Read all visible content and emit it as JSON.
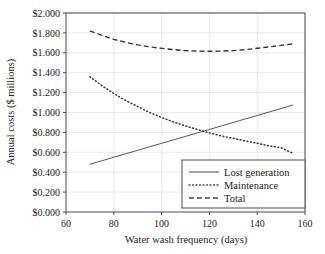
{
  "chart_data": {
    "type": "line",
    "title": "",
    "xlabel": "Water wash frequency (days)",
    "ylabel": "Annual costs ($ millions)",
    "xlim": [
      60,
      160
    ],
    "ylim": [
      0.0,
      2.0
    ],
    "xticks": [
      "60",
      "80",
      "100",
      "120",
      "140",
      "160"
    ],
    "xtick_values": [
      60,
      80,
      100,
      120,
      140,
      160
    ],
    "yticks": [
      "$0.000",
      "$0.200",
      "$0.400",
      "$0.600",
      "$0.800",
      "$1.000",
      "$1.200",
      "$1.400",
      "$1.600",
      "$1.800",
      "$2.000"
    ],
    "ytick_values": [
      0.0,
      0.2,
      0.4,
      0.6,
      0.8,
      1.0,
      1.2,
      1.4,
      1.6,
      1.8,
      2.0
    ],
    "grid": true,
    "legend_position": "lower-right",
    "x": [
      70,
      75,
      80,
      85,
      90,
      95,
      100,
      105,
      110,
      115,
      120,
      125,
      130,
      135,
      140,
      145,
      150,
      155
    ],
    "series": [
      {
        "name": "Lost generation",
        "style": "solid",
        "color": "#555555",
        "values": [
          0.48,
          0.515,
          0.55,
          0.585,
          0.62,
          0.655,
          0.69,
          0.725,
          0.76,
          0.795,
          0.83,
          0.865,
          0.9,
          0.935,
          0.97,
          1.005,
          1.04,
          1.075
        ]
      },
      {
        "name": "Maintenance",
        "style": "dotted",
        "color": "#333333",
        "values": [
          1.36,
          1.27,
          1.19,
          1.12,
          1.06,
          1.0,
          0.95,
          0.905,
          0.865,
          0.83,
          0.795,
          0.765,
          0.74,
          0.715,
          0.69,
          0.665,
          0.645,
          0.59
        ]
      },
      {
        "name": "Total",
        "style": "dashed",
        "color": "#333333",
        "values": [
          1.82,
          1.775,
          1.735,
          1.705,
          1.68,
          1.66,
          1.645,
          1.632,
          1.622,
          1.617,
          1.615,
          1.617,
          1.622,
          1.632,
          1.645,
          1.66,
          1.675,
          1.69
        ]
      }
    ],
    "legend": [
      {
        "label": "Lost generation",
        "style": "solid"
      },
      {
        "label": "Maintenance",
        "style": "dotted"
      },
      {
        "label": "Total",
        "style": "dashed"
      }
    ]
  }
}
